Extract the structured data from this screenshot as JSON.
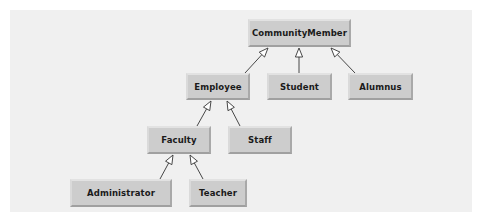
{
  "diagram": {
    "type": "class-hierarchy",
    "colors": {
      "background": "#ffffff",
      "panel": "#f0f0f0",
      "node_fill": "#cdcdcd",
      "edge": "#333333",
      "text": "#1a1a1a"
    },
    "nodes": [
      {
        "id": "communitymember",
        "label": "CommunityMember",
        "x": 248,
        "y": 19,
        "w": 103,
        "h": 28
      },
      {
        "id": "employee",
        "label": "Employee",
        "x": 186,
        "y": 73,
        "w": 64,
        "h": 27
      },
      {
        "id": "student",
        "label": "Student",
        "x": 267,
        "y": 73,
        "w": 65,
        "h": 27
      },
      {
        "id": "alumnus",
        "label": "Alumnus",
        "x": 348,
        "y": 73,
        "w": 65,
        "h": 27
      },
      {
        "id": "faculty",
        "label": "Faculty",
        "x": 147,
        "y": 126,
        "w": 64,
        "h": 28
      },
      {
        "id": "staff",
        "label": "Staff",
        "x": 228,
        "y": 126,
        "w": 64,
        "h": 28
      },
      {
        "id": "administrator",
        "label": "Administrator",
        "x": 70,
        "y": 179,
        "w": 102,
        "h": 28
      },
      {
        "id": "teacher",
        "label": "Teacher",
        "x": 189,
        "y": 179,
        "w": 58,
        "h": 28
      }
    ],
    "edges": [
      {
        "from": "employee",
        "to": "communitymember",
        "x1": 245,
        "y1": 73,
        "x2": 268,
        "y2": 48,
        "kind": "generalization"
      },
      {
        "from": "student",
        "to": "communitymember",
        "x1": 299,
        "y1": 73,
        "x2": 299,
        "y2": 48,
        "kind": "generalization"
      },
      {
        "from": "alumnus",
        "to": "communitymember",
        "x1": 355,
        "y1": 73,
        "x2": 331,
        "y2": 48,
        "kind": "generalization"
      },
      {
        "from": "faculty",
        "to": "employee",
        "x1": 197,
        "y1": 126,
        "x2": 211,
        "y2": 101,
        "kind": "generalization"
      },
      {
        "from": "staff",
        "to": "employee",
        "x1": 240,
        "y1": 126,
        "x2": 227,
        "y2": 101,
        "kind": "generalization"
      },
      {
        "from": "administrator",
        "to": "faculty",
        "x1": 160,
        "y1": 179,
        "x2": 173,
        "y2": 155,
        "kind": "generalization"
      },
      {
        "from": "teacher",
        "to": "faculty",
        "x1": 203,
        "y1": 179,
        "x2": 190,
        "y2": 155,
        "kind": "generalization"
      }
    ]
  }
}
